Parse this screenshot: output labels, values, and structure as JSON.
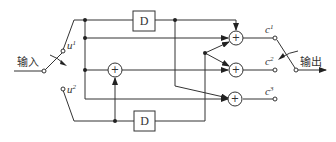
{
  "diagram": {
    "input_label": "输入",
    "output_label": "输出",
    "input_switch": {
      "terminals": [
        {
          "name": "u",
          "sup": "1"
        },
        {
          "name": "u",
          "sup": "2"
        }
      ]
    },
    "output_switch": {
      "terminals": [
        {
          "name": "c",
          "sup": "1"
        },
        {
          "name": "c",
          "sup": "2"
        },
        {
          "name": "c",
          "sup": "3"
        }
      ]
    },
    "delay_blocks": [
      {
        "label": "D"
      },
      {
        "label": "D"
      }
    ],
    "adder_symbol": "+",
    "colors": {
      "line": "#333333",
      "background": "#ffffff"
    }
  }
}
